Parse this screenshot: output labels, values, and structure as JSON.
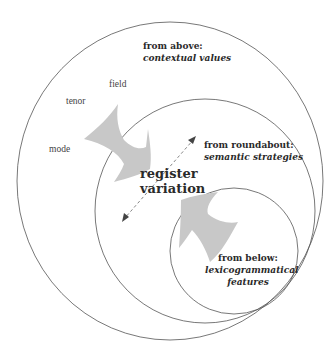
{
  "diagram": {
    "center_label": {
      "line1": "register",
      "line2": "variation"
    },
    "perspectives": [
      {
        "id": "above",
        "heading": "from above:",
        "subtitle": "contextual values"
      },
      {
        "id": "roundabout",
        "heading": "from roundabout:",
        "subtitle": "semantic strategies"
      },
      {
        "id": "below",
        "heading": "from below:",
        "subtitle1": "lexicogrammatical",
        "subtitle2": "features"
      }
    ],
    "context_variables": [
      "field",
      "tenor",
      "mode"
    ],
    "colors": {
      "circle_stroke": "#555555",
      "arrow_fill": "#c8c8c8",
      "dashed_arrow": "#666666",
      "text": "#2a2a2a"
    }
  }
}
